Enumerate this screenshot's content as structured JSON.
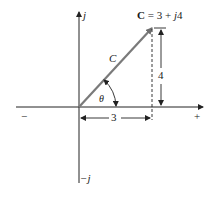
{
  "diagram": {
    "title_label": {
      "bold_part": "C",
      "rest": " = 3 + ",
      "j_part": "j",
      "tail": "4"
    },
    "axes": {
      "imag_positive_label": "j",
      "imag_negative_label": "−j",
      "real_negative_label": "−",
      "real_positive_label": "+"
    },
    "vector_label": "C",
    "angle_label": "θ",
    "horizontal_dimension_label": "3",
    "vertical_dimension_label": "4",
    "colors": {
      "axis": "#222222",
      "vector": "#7a7a7a",
      "text": "#1a1a1a"
    }
  }
}
